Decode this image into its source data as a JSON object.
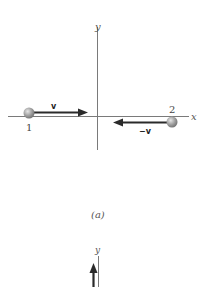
{
  "figure_a": {
    "axes": {
      "x_label": "x",
      "y_label": "y",
      "axis_color": "#7a7a7a"
    },
    "particle_1": {
      "label": "1",
      "velocity_label": "v",
      "direction": "right"
    },
    "particle_2": {
      "label": "2",
      "velocity_label": "−v",
      "direction": "left"
    },
    "ball_color": "#9a9a9a",
    "arrow_color": "#2a2a2a",
    "caption": "(a)"
  },
  "figure_b_partial": {
    "axes": {
      "y_label": "y"
    },
    "arrow_direction": "up"
  }
}
